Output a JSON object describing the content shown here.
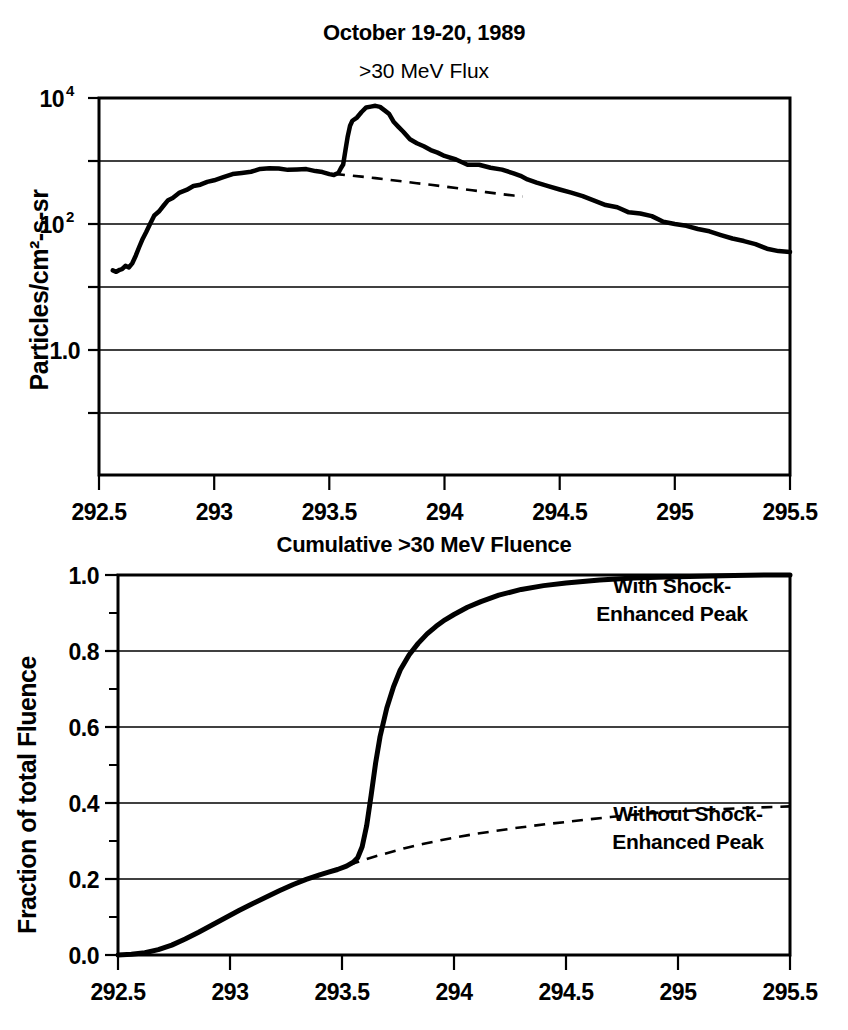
{
  "figure": {
    "background": "#ffffff",
    "ink_color": "#000000"
  },
  "chart_data": [
    {
      "id": "flux-panel",
      "type": "line",
      "title": "October 19-20, 1989",
      "subtitle": ">30 MeV Flux",
      "xlabel": "",
      "ylabel": "Particles/cm2-s-sr",
      "ylabel_display": "Particles/cm²-s-sr",
      "yscale": "log",
      "xlim": [
        292.5,
        295.5
      ],
      "ylim": [
        0.01,
        10000
      ],
      "grid": true,
      "xticks": [
        292.5,
        293,
        293.5,
        294,
        294.5,
        295,
        295.5
      ],
      "xtick_labels": [
        "292.5",
        "293",
        "293.5",
        "294",
        "294.5",
        "295",
        "295.5"
      ],
      "yticks": [
        10000,
        1000,
        100,
        10,
        1.0,
        0.1,
        0.01
      ],
      "ytick_labels": [
        "10^4",
        "",
        "10^2",
        "",
        "1.0",
        "",
        ""
      ],
      "ytick_labeled": [
        {
          "value": 10000,
          "base": "10",
          "exp": "4"
        },
        {
          "value": 100,
          "base": "10",
          "exp": "2"
        },
        {
          "value": 1.0,
          "base": "1.0",
          "exp": ""
        }
      ],
      "legend_position": "none",
      "series": [
        {
          "name": "Observed >30 MeV flux",
          "style": "solid",
          "x": [
            292.56,
            292.575,
            292.59,
            292.6,
            292.615,
            292.63,
            292.645,
            292.66,
            292.675,
            292.69,
            292.705,
            292.72,
            292.74,
            292.76,
            292.78,
            292.8,
            292.82,
            292.85,
            292.88,
            292.91,
            292.94,
            292.97,
            293.0,
            293.04,
            293.08,
            293.12,
            293.16,
            293.2,
            293.24,
            293.28,
            293.32,
            293.36,
            293.4,
            293.44,
            293.47,
            293.5,
            293.52,
            293.54,
            293.55,
            293.56,
            293.57,
            293.58,
            293.59,
            293.6,
            293.62,
            293.64,
            293.66,
            293.68,
            293.7,
            293.72,
            293.74,
            293.76,
            293.78,
            293.8,
            293.82,
            293.85,
            293.88,
            293.91,
            293.94,
            293.97,
            294.0,
            294.05,
            294.1,
            294.15,
            294.2,
            294.25,
            294.3,
            294.33,
            294.36,
            294.4,
            294.45,
            294.5,
            294.55,
            294.6,
            294.65,
            294.7,
            294.75,
            294.8,
            294.85,
            294.9,
            294.95,
            295.0,
            295.05,
            295.1,
            295.15,
            295.2,
            295.25,
            295.3,
            295.35,
            295.4,
            295.45,
            295.5
          ],
          "y": [
            17,
            18,
            17.5,
            19,
            21,
            20,
            24,
            30,
            42,
            58,
            78,
            100,
            130,
            165,
            200,
            235,
            270,
            310,
            350,
            390,
            430,
            465,
            500,
            545,
            590,
            630,
            670,
            700,
            730,
            750,
            760,
            750,
            720,
            680,
            640,
            620,
            630,
            680,
            760,
            900,
            1500,
            2600,
            3600,
            4200,
            5000,
            6200,
            6900,
            7300,
            7200,
            6900,
            6200,
            5300,
            4300,
            3500,
            2900,
            2300,
            1900,
            1650,
            1450,
            1300,
            1150,
            1000,
            900,
            820,
            740,
            690,
            640,
            560,
            500,
            440,
            390,
            350,
            300,
            260,
            225,
            200,
            175,
            155,
            140,
            125,
            110,
            98,
            88,
            80,
            72,
            65,
            58,
            52,
            47,
            42,
            38,
            34
          ]
        },
        {
          "name": "Inferred flux without shock-enhanced peak",
          "style": "dashed",
          "x": [
            293.52,
            293.58,
            293.64,
            293.7,
            293.76,
            293.82,
            293.88,
            293.94,
            294.0,
            294.06,
            294.12,
            294.18,
            294.24,
            294.3,
            294.34
          ],
          "y": [
            620,
            590,
            560,
            530,
            500,
            470,
            440,
            415,
            390,
            365,
            340,
            318,
            298,
            280,
            270
          ]
        }
      ]
    },
    {
      "id": "fluence-panel",
      "type": "line",
      "title": "Cumulative >30 MeV Fluence",
      "subtitle": "",
      "xlabel": "",
      "ylabel": "Fraction of total Fluence",
      "yscale": "linear",
      "xlim": [
        292.5,
        295.5
      ],
      "ylim": [
        0.0,
        1.0
      ],
      "grid": true,
      "xticks": [
        292.5,
        293,
        293.5,
        294,
        294.5,
        295,
        295.5
      ],
      "xtick_labels": [
        "292.5",
        "293",
        "293.5",
        "294",
        "294.5",
        "295",
        "295.5"
      ],
      "yticks": [
        0.0,
        0.2,
        0.4,
        0.6,
        0.8,
        1.0
      ],
      "ytick_labels": [
        "0.0",
        "0.2",
        "0.4",
        "0.6",
        "0.8",
        "1.0"
      ],
      "yticks_minor": [
        0.1,
        0.3,
        0.5,
        0.7,
        0.9
      ],
      "legend_position": "inline-annotations",
      "annotations": [
        {
          "id": "with-shock",
          "text_lines": [
            "With Shock-",
            "Enhanced Peak"
          ],
          "x": 294.55,
          "y": 0.9
        },
        {
          "id": "without-shock",
          "text_lines": [
            "Without Shock-",
            "Enhanced Peak"
          ],
          "x": 294.62,
          "y": 0.34
        }
      ],
      "series": [
        {
          "name": "With Shock-Enhanced Peak",
          "style": "solid-thick",
          "x": [
            292.5,
            292.56,
            292.62,
            292.68,
            292.74,
            292.8,
            292.86,
            292.92,
            292.98,
            293.04,
            293.1,
            293.16,
            293.22,
            293.28,
            293.34,
            293.4,
            293.44,
            293.48,
            293.52,
            293.55,
            293.57,
            293.59,
            293.61,
            293.63,
            293.65,
            293.67,
            293.7,
            293.73,
            293.76,
            293.8,
            293.84,
            293.88,
            293.92,
            293.96,
            294.0,
            294.06,
            294.12,
            294.2,
            294.3,
            294.4,
            294.5,
            294.65,
            294.8,
            294.95,
            295.1,
            295.25,
            295.4,
            295.5
          ],
          "y": [
            0.0,
            0.002,
            0.006,
            0.014,
            0.026,
            0.042,
            0.06,
            0.079,
            0.098,
            0.117,
            0.135,
            0.152,
            0.169,
            0.185,
            0.199,
            0.211,
            0.218,
            0.225,
            0.234,
            0.244,
            0.256,
            0.285,
            0.34,
            0.42,
            0.505,
            0.575,
            0.65,
            0.706,
            0.75,
            0.79,
            0.82,
            0.845,
            0.865,
            0.882,
            0.896,
            0.915,
            0.93,
            0.947,
            0.962,
            0.972,
            0.979,
            0.987,
            0.992,
            0.995,
            0.997,
            0.999,
            1.0,
            1.0
          ]
        },
        {
          "name": "Without Shock-Enhanced Peak",
          "style": "dashed",
          "x": [
            293.53,
            293.58,
            293.64,
            293.7,
            293.78,
            293.86,
            293.94,
            294.02,
            294.1,
            294.18,
            294.26,
            294.34,
            294.42,
            294.5,
            294.6,
            294.7,
            294.8,
            294.9,
            295.0,
            295.15,
            295.3,
            295.45,
            295.5
          ],
          "y": [
            0.237,
            0.247,
            0.258,
            0.268,
            0.281,
            0.292,
            0.302,
            0.311,
            0.319,
            0.326,
            0.333,
            0.339,
            0.345,
            0.35,
            0.357,
            0.363,
            0.369,
            0.374,
            0.378,
            0.383,
            0.387,
            0.39,
            0.391
          ]
        }
      ]
    }
  ]
}
